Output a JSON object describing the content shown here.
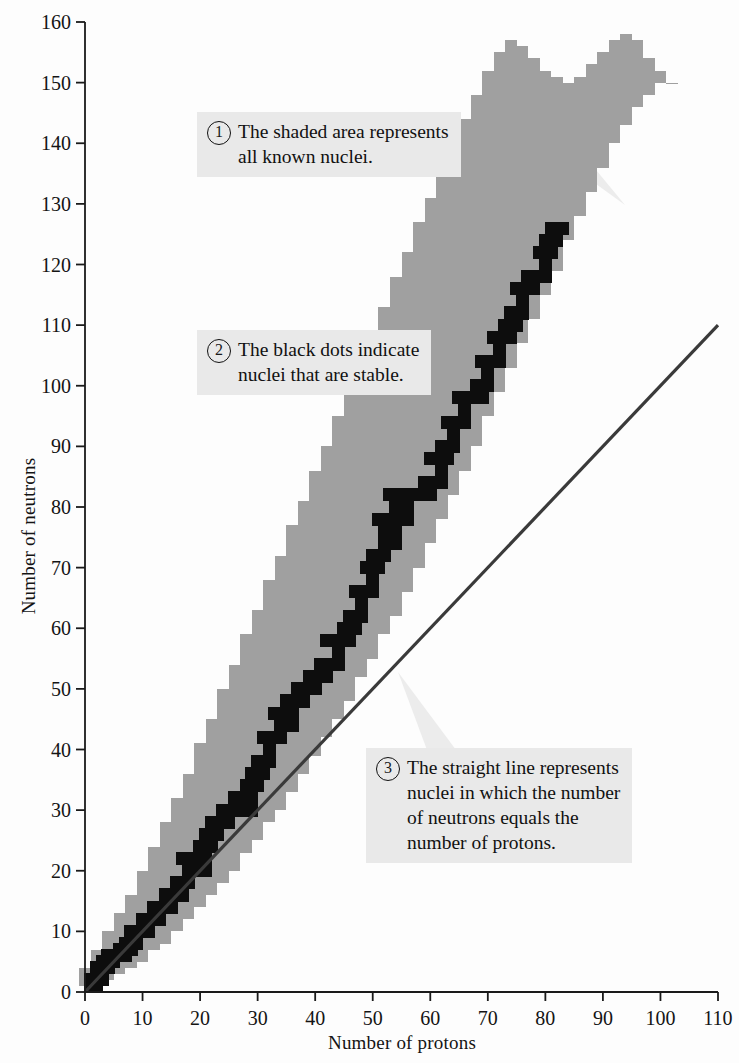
{
  "chart_data": {
    "type": "area",
    "title": "",
    "xlabel": "Number of protons",
    "ylabel": "Number of neutrons",
    "xlim": [
      0,
      110
    ],
    "ylim": [
      0,
      160
    ],
    "xticks": [
      0,
      10,
      20,
      30,
      40,
      50,
      60,
      70,
      80,
      90,
      100,
      110
    ],
    "yticks": [
      0,
      10,
      20,
      30,
      40,
      50,
      60,
      70,
      80,
      90,
      100,
      110,
      120,
      130,
      140,
      150,
      160
    ],
    "grid": false,
    "legend": "none",
    "colors": {
      "known_nuclei_band": "#a0a0a0",
      "stable_nuclei": "#0d0d0d",
      "nz_line": "#3a3a3a",
      "callout_background": "#e9e9e9",
      "axis": "#1a1a1a",
      "background": "#fdfdfd"
    },
    "series": [
      {
        "name": "All known nuclei (shaded area)",
        "type": "band",
        "description": "Region of proton/neutron combinations for every nucleus that has been observed.",
        "z": [
          0,
          2,
          4,
          6,
          8,
          10,
          12,
          14,
          16,
          18,
          20,
          22,
          24,
          26,
          28,
          30,
          32,
          34,
          36,
          38,
          40,
          42,
          44,
          46,
          48,
          50,
          52,
          54,
          56,
          58,
          60,
          62,
          64,
          66,
          68,
          70,
          72,
          74,
          76,
          78,
          80,
          82,
          84,
          86,
          88,
          90,
          92,
          94,
          96,
          98,
          100,
          102
        ],
        "n_min": [
          1,
          1,
          2,
          3,
          4,
          5,
          7,
          8,
          10,
          12,
          14,
          16,
          18,
          20,
          23,
          25,
          28,
          30,
          33,
          36,
          39,
          42,
          45,
          48,
          52,
          55,
          59,
          62,
          66,
          70,
          74,
          78,
          82,
          86,
          90,
          95,
          99,
          103,
          107,
          111,
          115,
          119,
          124,
          128,
          132,
          136,
          140,
          143,
          146,
          148,
          150,
          152
        ],
        "n_max": [
          4,
          7,
          10,
          13,
          16,
          20,
          24,
          28,
          32,
          36,
          41,
          45,
          50,
          54,
          59,
          63,
          68,
          72,
          77,
          81,
          86,
          90,
          95,
          99,
          104,
          109,
          113,
          118,
          122,
          127,
          131,
          136,
          140,
          144,
          148,
          152,
          155,
          157,
          156,
          154,
          152,
          151,
          150,
          151,
          153,
          155,
          157,
          158,
          157,
          154,
          152,
          150
        ]
      },
      {
        "name": "Stable nuclei (black dots)",
        "type": "scatter",
        "description": "Nuclei that do not undergo radioactive decay; they trace the valley of stability.",
        "points": [
          [
            1,
            1
          ],
          [
            2,
            2
          ],
          [
            3,
            4
          ],
          [
            4,
            5
          ],
          [
            5,
            6
          ],
          [
            6,
            6
          ],
          [
            7,
            7
          ],
          [
            8,
            8
          ],
          [
            9,
            10
          ],
          [
            10,
            10
          ],
          [
            11,
            12
          ],
          [
            12,
            12
          ],
          [
            13,
            14
          ],
          [
            14,
            14
          ],
          [
            15,
            16
          ],
          [
            16,
            16
          ],
          [
            17,
            18
          ],
          [
            18,
            22
          ],
          [
            19,
            20
          ],
          [
            20,
            20
          ],
          [
            21,
            24
          ],
          [
            22,
            26
          ],
          [
            23,
            28
          ],
          [
            24,
            28
          ],
          [
            25,
            30
          ],
          [
            26,
            30
          ],
          [
            27,
            32
          ],
          [
            28,
            30
          ],
          [
            29,
            34
          ],
          [
            30,
            36
          ],
          [
            31,
            38
          ],
          [
            32,
            42
          ],
          [
            33,
            42
          ],
          [
            34,
            46
          ],
          [
            35,
            44
          ],
          [
            36,
            48
          ],
          [
            37,
            48
          ],
          [
            38,
            50
          ],
          [
            39,
            50
          ],
          [
            40,
            52
          ],
          [
            41,
            52
          ],
          [
            42,
            54
          ],
          [
            44,
            58
          ],
          [
            45,
            58
          ],
          [
            46,
            60
          ],
          [
            47,
            62
          ],
          [
            48,
            66
          ],
          [
            49,
            66
          ],
          [
            50,
            70
          ],
          [
            51,
            72
          ],
          [
            52,
            78
          ],
          [
            53,
            74
          ],
          [
            54,
            82
          ],
          [
            55,
            78
          ],
          [
            56,
            82
          ],
          [
            57,
            82
          ],
          [
            58,
            82
          ],
          [
            59,
            82
          ],
          [
            60,
            84
          ],
          [
            62,
            88
          ],
          [
            63,
            90
          ],
          [
            64,
            94
          ],
          [
            65,
            94
          ],
          [
            66,
            98
          ],
          [
            67,
            98
          ],
          [
            68,
            98
          ],
          [
            69,
            100
          ],
          [
            70,
            104
          ],
          [
            71,
            104
          ],
          [
            72,
            108
          ],
          [
            73,
            108
          ],
          [
            74,
            110
          ],
          [
            75,
            112
          ],
          [
            76,
            116
          ],
          [
            77,
            116
          ],
          [
            78,
            118
          ],
          [
            79,
            118
          ],
          [
            80,
            122
          ],
          [
            81,
            124
          ],
          [
            82,
            126
          ],
          [
            83,
            126
          ]
        ]
      },
      {
        "name": "N = Z line",
        "type": "line",
        "description": "Straight line where the number of neutrons equals the number of protons.",
        "x": [
          0,
          110
        ],
        "y": [
          0,
          110
        ]
      }
    ],
    "annotations": [
      {
        "id": 1,
        "number": "1",
        "lines": [
          "The shaded area represents",
          "all known nuclei."
        ],
        "points_to": "known_nuclei_band"
      },
      {
        "id": 2,
        "number": "2",
        "lines": [
          "The black dots indicate",
          "nuclei that are stable."
        ],
        "points_to": "stable_nuclei"
      },
      {
        "id": 3,
        "number": "3",
        "lines": [
          "The straight line represents",
          "nuclei in which the number",
          "of neutrons equals the",
          "number of protons."
        ],
        "points_to": "nz_line"
      }
    ]
  },
  "annotations": {
    "a1": {
      "number": "1",
      "line1": "The shaded area represents",
      "line2": "all known nuclei."
    },
    "a2": {
      "number": "2",
      "line1": "The black dots indicate",
      "line2": "nuclei that are stable."
    },
    "a3": {
      "number": "3",
      "line1": "The straight line represents",
      "line2": "nuclei in which the number",
      "line3": "of neutrons equals the",
      "line4": "number of protons."
    }
  },
  "axes": {
    "x_title": "Number of protons",
    "y_title": "Number of neutrons"
  }
}
